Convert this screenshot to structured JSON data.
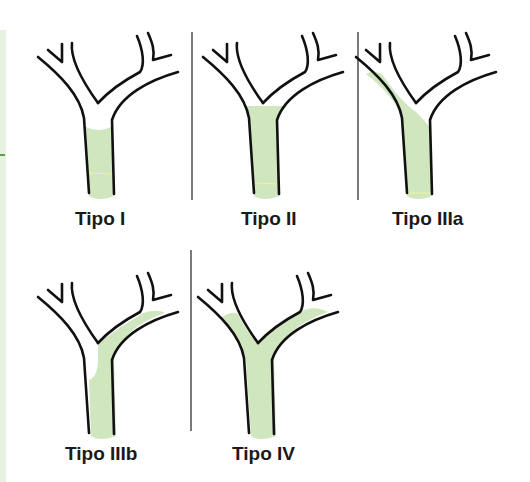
{
  "figure": {
    "title": "",
    "colors": {
      "fill": "#cfe6bf",
      "stroke": "#111111",
      "divider": "#333333",
      "edge_strip": "#e6f3de",
      "edge_tick": "#5aa04a"
    },
    "panels": [
      {
        "id": "tipo-i",
        "label": "Tipo I",
        "region": "common duct only"
      },
      {
        "id": "tipo-ii",
        "label": "Tipo II",
        "region": "common duct up to confluence"
      },
      {
        "id": "tipo-iiia",
        "label": "Tipo IIIa",
        "region": "common duct and left branch"
      },
      {
        "id": "tipo-iiib",
        "label": "Tipo IIIb",
        "region": "common duct and right branch"
      },
      {
        "id": "tipo-iv",
        "label": "Tipo IV",
        "region": "common duct and both branches"
      }
    ]
  }
}
